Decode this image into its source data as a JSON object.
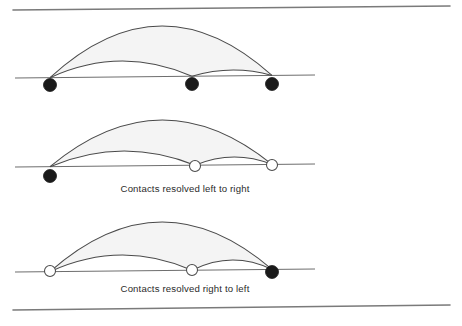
{
  "figure": {
    "width": 462,
    "height": 326,
    "background_color": "#ffffff",
    "stroke_color": "#4a4a4a",
    "baseline_color": "#6e6e6e",
    "border_color": "#7a7a7a",
    "fill_color": "#f4f4f4",
    "node_filled_color": "#1a1a1a",
    "node_hollow_fill": "#ffffff"
  },
  "borders": {
    "top": {
      "x1": 13,
      "y1": 10,
      "x2": 450,
      "y2": 6
    },
    "bottom": {
      "x1": 13,
      "y1": 310,
      "x2": 450,
      "y2": 305
    }
  },
  "panels": [
    {
      "id": "panel-unresolved",
      "caption": "",
      "baseline": {
        "x1": 15,
        "y1": 78,
        "x2": 315,
        "y2": 75
      },
      "nodes": [
        {
          "id": "node-left",
          "x": 50,
          "y": 85,
          "r": 6.5,
          "style": "filled",
          "label": "left contact"
        },
        {
          "id": "node-middle",
          "x": 192,
          "y": 84,
          "r": 6.5,
          "style": "filled",
          "label": "middle contact"
        },
        {
          "id": "node-right",
          "x": 272,
          "y": 84,
          "r": 6.5,
          "style": "filled",
          "label": "right contact"
        }
      ],
      "arcs": [
        {
          "id": "arc-outer",
          "from_x": 50,
          "to_x": 272,
          "peak_y": 26,
          "label": "outer span arc"
        },
        {
          "id": "arc-left-mid",
          "from_x": 50,
          "to_x": 192,
          "peak_y": 61,
          "label": "left-to-middle arc"
        },
        {
          "id": "arc-mid-right",
          "from_x": 192,
          "to_x": 272,
          "peak_y": 70,
          "label": "middle-to-right arc"
        }
      ]
    },
    {
      "id": "panel-left-to-right",
      "caption": "Contacts resolved left to right",
      "caption_x": 185,
      "caption_y": 192,
      "baseline": {
        "x1": 15,
        "y1": 167,
        "x2": 315,
        "y2": 164
      },
      "nodes": [
        {
          "id": "node-left",
          "x": 50,
          "y": 176,
          "r": 6.5,
          "style": "filled",
          "label": "left contact"
        },
        {
          "id": "node-middle",
          "x": 195,
          "y": 166,
          "r": 5.5,
          "style": "hollow",
          "label": "middle contact"
        },
        {
          "id": "node-right",
          "x": 272,
          "y": 165,
          "r": 5.5,
          "style": "hollow",
          "label": "right contact"
        }
      ],
      "arcs": [
        {
          "id": "arc-outer",
          "from_x": 50,
          "to_x": 272,
          "peak_y": 120,
          "label": "outer span arc"
        },
        {
          "id": "arc-left-mid",
          "from_x": 50,
          "to_x": 195,
          "peak_y": 151,
          "label": "left-to-middle arc"
        },
        {
          "id": "arc-mid-right",
          "from_x": 195,
          "to_x": 272,
          "peak_y": 157,
          "label": "middle-to-right arc"
        }
      ]
    },
    {
      "id": "panel-right-to-left",
      "caption": "Contacts resolved right to left",
      "caption_x": 185,
      "caption_y": 292,
      "baseline": {
        "x1": 15,
        "y1": 272,
        "x2": 315,
        "y2": 269
      },
      "nodes": [
        {
          "id": "node-left",
          "x": 50,
          "y": 271,
          "r": 5.5,
          "style": "hollow",
          "label": "left contact"
        },
        {
          "id": "node-middle",
          "x": 192,
          "y": 270,
          "r": 5.5,
          "style": "hollow",
          "label": "middle contact"
        },
        {
          "id": "node-right",
          "x": 272,
          "y": 272,
          "r": 6.5,
          "style": "filled",
          "label": "right contact"
        }
      ],
      "arcs": [
        {
          "id": "arc-outer",
          "from_x": 50,
          "to_x": 272,
          "peak_y": 222,
          "label": "outer span arc"
        },
        {
          "id": "arc-left-mid",
          "from_x": 50,
          "to_x": 192,
          "peak_y": 255,
          "label": "left-to-middle arc"
        },
        {
          "id": "arc-mid-right",
          "from_x": 192,
          "to_x": 272,
          "peak_y": 260,
          "label": "middle-to-right arc"
        }
      ]
    }
  ]
}
